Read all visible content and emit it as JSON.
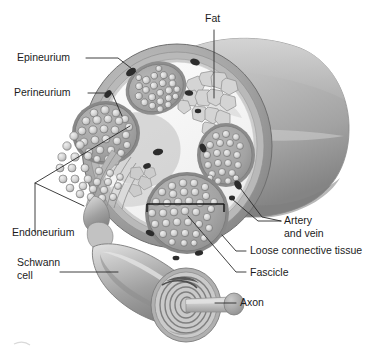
{
  "figure": {
    "type": "anatomical-illustration",
    "palette": {
      "background": "#ffffff",
      "ink": "#1c1c1c",
      "leader": "#2a2a2a",
      "epineurium_outer": "#8d8d8d",
      "epineurium_mid": "#a8a8a8",
      "trunk_body": "#b4b4b4",
      "trunk_shadow": "#7e7e7e",
      "trunk_notch": "#4a4a4a",
      "connective_tissue": "#f4f4f4",
      "fascicle_fill": "#a5a5a5",
      "fascicle_rim": "#8a8a8a",
      "axon_profile": "#e8e8e8",
      "fat_cell": "#cfcfcf",
      "vessel": "#2e2e2e",
      "schwann_body": "#a9a9a9",
      "schwann_light": "#d8d8d8",
      "myelin": "#bdbdbd",
      "axon_core": "#c8c8c8"
    }
  },
  "labels": {
    "fat": {
      "text": "Fat",
      "x": 205,
      "y": 22
    },
    "epineurium": {
      "text": "Epineurium",
      "x": 17,
      "y": 61
    },
    "perineurium": {
      "text": "Perineurium",
      "x": 14,
      "y": 96
    },
    "endoneurium": {
      "text": "Endoneurium",
      "x": 12,
      "y": 236
    },
    "schwann_cell_line1": {
      "text": "Schwann",
      "x": 17,
      "y": 266
    },
    "schwann_cell_line2": {
      "text": "cell",
      "x": 17,
      "y": 279
    },
    "artery_line1": {
      "text": "Artery",
      "x": 284,
      "y": 224
    },
    "artery_line2": {
      "text": "and vein",
      "x": 284,
      "y": 237
    },
    "loose_connective_tissue": {
      "text": "Loose connective tissue",
      "x": 250,
      "y": 254
    },
    "fascicle": {
      "text": "Fascicle",
      "x": 250,
      "y": 276
    },
    "axon": {
      "text": "Axon",
      "x": 240,
      "y": 306
    }
  },
  "structures": [
    {
      "name": "fat",
      "description": "Cluster of adipocytes inside epineurium, upper right of cross-section"
    },
    {
      "name": "epineurium",
      "description": "Outermost connective tissue sheath surrounding whole nerve trunk"
    },
    {
      "name": "perineurium",
      "description": "Sheath surrounding each individual fascicle"
    },
    {
      "name": "endoneurium",
      "description": "Connective tissue surrounding individual nerve fibers"
    },
    {
      "name": "schwann-cell",
      "description": "Myelinating glial cell wrapped around a single axon"
    },
    {
      "name": "artery-and-vein",
      "description": "Blood vessels within the epineurium"
    },
    {
      "name": "loose-connective-tissue",
      "description": "Areolar tissue filling space between fascicles"
    },
    {
      "name": "fascicle",
      "description": "Bundle of nerve fibers enclosed by perineurium"
    },
    {
      "name": "axon",
      "description": "Nerve fiber core emerging from myelin sheath"
    }
  ],
  "fascicles": [
    {
      "id": "fascicle-upper-left",
      "cx": 156,
      "cy": 88,
      "rx": 29,
      "ry": 25,
      "rotation": -22,
      "axon_count": 23
    },
    {
      "id": "fascicle-left-cut",
      "cx": 106,
      "cy": 133,
      "rx": 31,
      "ry": 29,
      "rotation": 0,
      "axon_count": 26
    },
    {
      "id": "fascicle-right",
      "cx": 226,
      "cy": 155,
      "rx": 26,
      "ry": 29,
      "rotation": 0,
      "axon_count": 22
    },
    {
      "id": "fascicle-lower-center",
      "cx": 187,
      "cy": 213,
      "rx": 39,
      "ry": 38,
      "rotation": 0,
      "axon_count": 33
    }
  ]
}
